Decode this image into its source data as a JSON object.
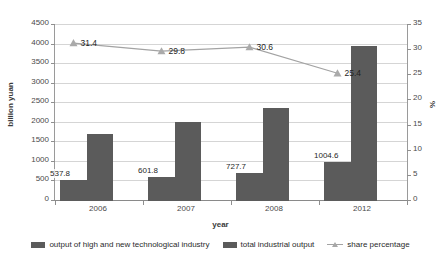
{
  "chart_data": {
    "type": "bar",
    "title": "",
    "subtitle": "",
    "xlabel": "year",
    "ylabel": "billion yuan",
    "y2label": "%",
    "categories": [
      "2006",
      "2007",
      "2008",
      "2012"
    ],
    "ylim": [
      0,
      4500
    ],
    "y2lim": [
      0,
      35
    ],
    "yticks": [
      "0",
      "500",
      "1000",
      "1500",
      "2000",
      "2500",
      "3000",
      "3500",
      "4000",
      "4500"
    ],
    "y2ticks": [
      "0",
      "5",
      "10",
      "15",
      "20",
      "25",
      "30",
      "35"
    ],
    "grid": true,
    "legend_position": "bottom",
    "series": [
      {
        "name": "output of high and new technological industry",
        "type": "bar",
        "axis": "left",
        "color": "#5b5b5b",
        "values": [
          537.8,
          601.8,
          727.7,
          1004.6
        ],
        "labels": [
          "537.8",
          "601.8",
          "727.7",
          "1004.6"
        ]
      },
      {
        "name": "total industrial output",
        "type": "bar",
        "axis": "left",
        "color": "#5b5b5b",
        "values": [
          1712,
          2020,
          2379,
          3955
        ],
        "labels": [
          "",
          "",
          "",
          ""
        ]
      },
      {
        "name": "share percentage",
        "type": "line",
        "axis": "right",
        "color": "#a3a3a3",
        "marker": "triangle",
        "values": [
          31.4,
          29.8,
          30.6,
          25.4
        ],
        "labels": [
          "31.4",
          "29.8",
          "30.6",
          "25.4"
        ]
      }
    ]
  },
  "legend": {
    "items": [
      {
        "label": "output of high and new technological industry",
        "marker": "bar-swatch"
      },
      {
        "label": "total industrial output",
        "marker": "bar-swatch"
      },
      {
        "label": "share percentage",
        "marker": "line-triangle"
      }
    ]
  }
}
